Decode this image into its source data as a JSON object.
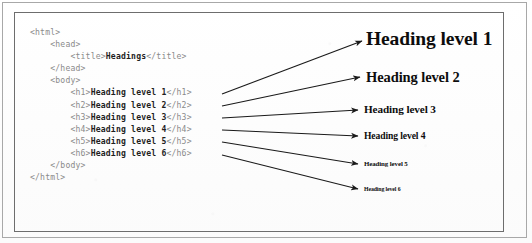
{
  "figure": {
    "kind": "html-headings-illustration",
    "code_language": "html",
    "code_lines": [
      {
        "indent": 0,
        "tag_open": "<html>",
        "content": "",
        "tag_close": ""
      },
      {
        "indent": 1,
        "tag_open": "<head>",
        "content": "",
        "tag_close": ""
      },
      {
        "indent": 2,
        "tag_open": "<title>",
        "content": "Headings",
        "tag_close": "</title>"
      },
      {
        "indent": 1,
        "tag_open": "</head>",
        "content": "",
        "tag_close": ""
      },
      {
        "indent": 1,
        "tag_open": "<body>",
        "content": "",
        "tag_close": ""
      },
      {
        "indent": 2,
        "tag_open": "<h1>",
        "content": "Heading level 1",
        "tag_close": "</h1>"
      },
      {
        "indent": 2,
        "tag_open": "<h2>",
        "content": "Heading level 2",
        "tag_close": "</h2>"
      },
      {
        "indent": 2,
        "tag_open": "<h3>",
        "content": "Heading level 3",
        "tag_close": "</h3>"
      },
      {
        "indent": 2,
        "tag_open": "<h4>",
        "content": "Heading level 4",
        "tag_close": "</h4>"
      },
      {
        "indent": 2,
        "tag_open": "<h5>",
        "content": "Heading level 5",
        "tag_close": "</h5>"
      },
      {
        "indent": 2,
        "tag_open": "<h6>",
        "content": "Heading level 6",
        "tag_close": "</h6>"
      },
      {
        "indent": 1,
        "tag_open": "</body>",
        "content": "",
        "tag_close": ""
      },
      {
        "indent": 0,
        "tag_open": "</html>",
        "content": "",
        "tag_close": ""
      }
    ],
    "rendered_headings": [
      {
        "level": "h1",
        "label": "Heading level 1"
      },
      {
        "level": "h2",
        "label": "Heading level 2"
      },
      {
        "level": "h3",
        "label": "Heading level 3"
      },
      {
        "level": "h4",
        "label": "Heading level 4"
      },
      {
        "level": "h5",
        "label": "Heading level 5"
      },
      {
        "level": "h6",
        "label": "Heading level 6"
      }
    ],
    "arrows": [
      {
        "from": "h1",
        "to": "heading-1",
        "x1": 222,
        "y1": 94,
        "x2": 362,
        "y2": 41
      },
      {
        "from": "h2",
        "to": "heading-2",
        "x1": 222,
        "y1": 106,
        "x2": 360,
        "y2": 77
      },
      {
        "from": "h3",
        "to": "heading-3",
        "x1": 222,
        "y1": 118,
        "x2": 358,
        "y2": 110
      },
      {
        "from": "h4",
        "to": "heading-4",
        "x1": 222,
        "y1": 130,
        "x2": 358,
        "y2": 136
      },
      {
        "from": "h5",
        "to": "heading-5",
        "x1": 222,
        "y1": 142,
        "x2": 358,
        "y2": 164
      },
      {
        "from": "h6",
        "to": "heading-6",
        "x1": 222,
        "y1": 155,
        "x2": 358,
        "y2": 189
      }
    ],
    "colors": {
      "page_background": "#fefefe",
      "outer_border": "#a8a8a8",
      "inner_border": "#6d6d6d",
      "code_tag": "#8a8a8a",
      "code_content": "#1e1e1e",
      "heading_text": "#0d0d0d",
      "arrow": "#1a1a1a"
    }
  }
}
